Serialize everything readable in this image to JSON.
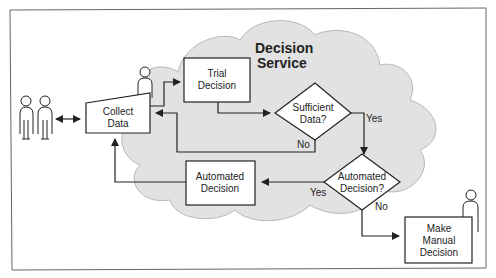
{
  "diagram": {
    "title_line1": "Decision",
    "title_line2": "Service",
    "nodes": {
      "collect_data": {
        "line1": "Collect",
        "line2": "Data"
      },
      "trial_decision": {
        "line1": "Trial",
        "line2": "Decision"
      },
      "sufficient_data": {
        "line1": "Sufficient",
        "line2": "Data?"
      },
      "automated_decision_q": {
        "line1": "Automated",
        "line2": "Decision?"
      },
      "automated_decision": {
        "line1": "Automated",
        "line2": "Decision"
      },
      "manual_decision": {
        "line1": "Make",
        "line2": "Manual",
        "line3": "Decision"
      }
    },
    "edge_labels": {
      "sufficient_yes": "Yes",
      "sufficient_no": "No",
      "automated_yes": "Yes",
      "automated_no": "No"
    },
    "colors": {
      "cloud_fill": "#e2e2e2",
      "cloud_stroke": "#b8b8b8",
      "line": "#222222",
      "frame": "#666666"
    }
  }
}
